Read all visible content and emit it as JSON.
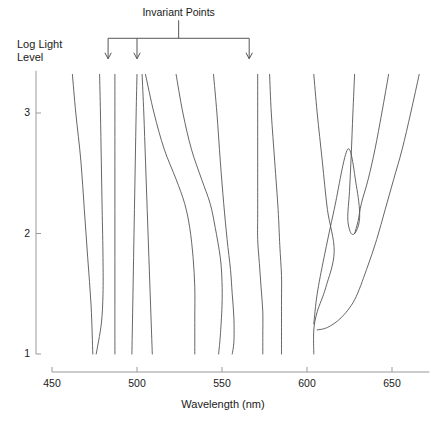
{
  "figure": {
    "annotation_label": "Invariant Points",
    "y_axis_caption": "Log Light\nLevel"
  },
  "chart_data": {
    "type": "line",
    "title": "",
    "subtitle": "",
    "xlabel": "Wavelength (nm)",
    "ylabel": "Log Light Level",
    "xlim": [
      450,
      672
    ],
    "ylim": [
      1,
      3.35
    ],
    "xticks": [
      450,
      500,
      550,
      600,
      650
    ],
    "xtick_labels": [
      "450",
      "500",
      "550",
      "600",
      "650"
    ],
    "yticks": [
      1,
      2,
      3
    ],
    "ytick_labels": [
      "1",
      "2",
      "3"
    ],
    "grid": false,
    "legend": "none",
    "line_color": "#555555",
    "axis_color": "#999999",
    "annotations": [
      {
        "label": "Invariant Points",
        "kind": "bracket-with-arrows",
        "arrow_x_values": [
          483,
          500,
          566
        ],
        "bracket_y": 3.62,
        "arrow_tip_y": 3.45
      }
    ],
    "series": [
      {
        "name": "curve-1",
        "points": [
          [
            462,
            3.32
          ],
          [
            464,
            3.0
          ],
          [
            467,
            2.6
          ],
          [
            469,
            2.2
          ],
          [
            471,
            1.8
          ],
          [
            473,
            1.4
          ],
          [
            474,
            1.0
          ]
        ]
      },
      {
        "name": "curve-2",
        "points": [
          [
            478,
            3.32
          ],
          [
            478.5,
            3.0
          ],
          [
            479,
            2.6
          ],
          [
            479.5,
            2.2
          ],
          [
            480,
            1.8
          ],
          [
            480,
            1.5
          ],
          [
            479,
            1.25
          ],
          [
            476,
            1.0
          ]
        ]
      },
      {
        "name": "curve-3",
        "points": [
          [
            487,
            3.32
          ],
          [
            487,
            3.0
          ],
          [
            487,
            2.6
          ],
          [
            487,
            2.2
          ],
          [
            487,
            1.8
          ],
          [
            487,
            1.4
          ],
          [
            487,
            1.0
          ]
        ]
      },
      {
        "name": "curve-4",
        "points": [
          [
            500,
            3.32
          ],
          [
            499.5,
            3.0
          ],
          [
            499,
            2.6
          ],
          [
            498.5,
            2.2
          ],
          [
            498,
            1.8
          ],
          [
            497.5,
            1.4
          ],
          [
            497,
            1.0
          ]
        ]
      },
      {
        "name": "curve-5",
        "points": [
          [
            503,
            3.32
          ],
          [
            504,
            3.0
          ],
          [
            505,
            2.6
          ],
          [
            506,
            2.2
          ],
          [
            507,
            1.8
          ],
          [
            508,
            1.4
          ],
          [
            509,
            1.0
          ]
        ]
      },
      {
        "name": "curve-6",
        "points": [
          [
            505,
            3.32
          ],
          [
            510,
            3.0
          ],
          [
            516,
            2.7
          ],
          [
            523,
            2.45
          ],
          [
            528,
            2.25
          ],
          [
            531,
            2.05
          ],
          [
            533,
            1.8
          ],
          [
            534,
            1.55
          ],
          [
            534,
            1.3
          ],
          [
            534,
            1.0
          ]
        ]
      },
      {
        "name": "curve-7",
        "points": [
          [
            523,
            3.32
          ],
          [
            527,
            3.0
          ],
          [
            532,
            2.7
          ],
          [
            538,
            2.45
          ],
          [
            543,
            2.25
          ],
          [
            546,
            2.05
          ],
          [
            549,
            1.8
          ],
          [
            550,
            1.6
          ],
          [
            550,
            1.4
          ],
          [
            549,
            1.15
          ],
          [
            548,
            1.0
          ]
        ]
      },
      {
        "name": "curve-8",
        "points": [
          [
            545,
            3.32
          ],
          [
            547,
            3.0
          ],
          [
            549,
            2.6
          ],
          [
            551,
            2.25
          ],
          [
            553,
            1.95
          ],
          [
            555,
            1.7
          ],
          [
            556,
            1.5
          ],
          [
            557,
            1.3
          ],
          [
            557,
            1.1
          ],
          [
            556,
            1.0
          ]
        ]
      },
      {
        "name": "curve-9",
        "points": [
          [
            571,
            3.32
          ],
          [
            571,
            3.0
          ],
          [
            571,
            2.6
          ],
          [
            571,
            2.2
          ],
          [
            571,
            1.95
          ],
          [
            572,
            1.75
          ],
          [
            573,
            1.55
          ],
          [
            574,
            1.35
          ],
          [
            574,
            1.15
          ],
          [
            574,
            1.0
          ]
        ]
      },
      {
        "name": "curve-10",
        "points": [
          [
            578,
            3.32
          ],
          [
            579,
            3.0
          ],
          [
            581,
            2.6
          ],
          [
            583,
            2.2
          ],
          [
            584,
            1.9
          ],
          [
            585,
            1.65
          ],
          [
            585,
            1.45
          ],
          [
            585,
            1.25
          ],
          [
            585,
            1.0
          ]
        ]
      },
      {
        "name": "curve-11",
        "points": [
          [
            604,
            3.32
          ],
          [
            606,
            3.0
          ],
          [
            609,
            2.6
          ],
          [
            612,
            2.2
          ],
          [
            616,
            1.85
          ],
          [
            611,
            1.55
          ],
          [
            606,
            1.35
          ],
          [
            604,
            1.2
          ],
          [
            604,
            1.0
          ]
        ]
      },
      {
        "name": "curve-12-hook",
        "points": [
          [
            628,
            3.32
          ],
          [
            627,
            3.0
          ],
          [
            626,
            2.65
          ],
          [
            625,
            2.35
          ],
          [
            624,
            2.12
          ],
          [
            626,
            2.0
          ],
          [
            629,
            2.02
          ],
          [
            631,
            2.15
          ],
          [
            629,
            2.4
          ],
          [
            624,
            2.7
          ],
          [
            616,
            2.2
          ],
          [
            610,
            1.8
          ],
          [
            606,
            1.5
          ],
          [
            604,
            1.25
          ]
        ]
      },
      {
        "name": "curve-13",
        "points": [
          [
            648,
            3.32
          ],
          [
            644,
            3.0
          ],
          [
            640,
            2.7
          ],
          [
            636,
            2.45
          ],
          [
            632,
            2.25
          ],
          [
            630,
            2.1
          ],
          [
            628,
            2.0
          ]
        ]
      },
      {
        "name": "curve-14",
        "points": [
          [
            666,
            3.32
          ],
          [
            661,
            3.0
          ],
          [
            656,
            2.7
          ],
          [
            651,
            2.45
          ],
          [
            646,
            2.2
          ],
          [
            641,
            1.95
          ],
          [
            635,
            1.7
          ],
          [
            628,
            1.45
          ],
          [
            620,
            1.3
          ],
          [
            612,
            1.22
          ],
          [
            606,
            1.2
          ]
        ]
      }
    ]
  }
}
